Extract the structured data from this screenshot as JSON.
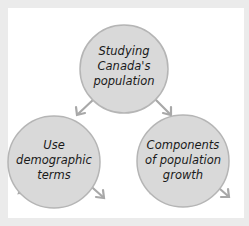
{
  "diagram": {
    "colors": {
      "background": "#ebebeb",
      "card": "#ffffff",
      "node_fill": "#d9d9d9",
      "node_stroke": "#b5b5b5",
      "arrow": "#a8a8a8",
      "text": "#1a1a1a"
    },
    "nodes": [
      {
        "id": "root",
        "lines": [
          "Studying",
          "Canada's",
          "population"
        ]
      },
      {
        "id": "left",
        "lines": [
          "Use",
          "demographic",
          "terms"
        ]
      },
      {
        "id": "right",
        "lines": [
          "Components",
          "of population",
          "growth"
        ]
      }
    ],
    "edges": [
      {
        "from": "root",
        "to": "left"
      },
      {
        "from": "root",
        "to": "right"
      },
      {
        "from": "left",
        "to": "off-left"
      },
      {
        "from": "left",
        "to": "off-right"
      },
      {
        "from": "right",
        "to": "off-left"
      },
      {
        "from": "right",
        "to": "off-right"
      }
    ]
  }
}
